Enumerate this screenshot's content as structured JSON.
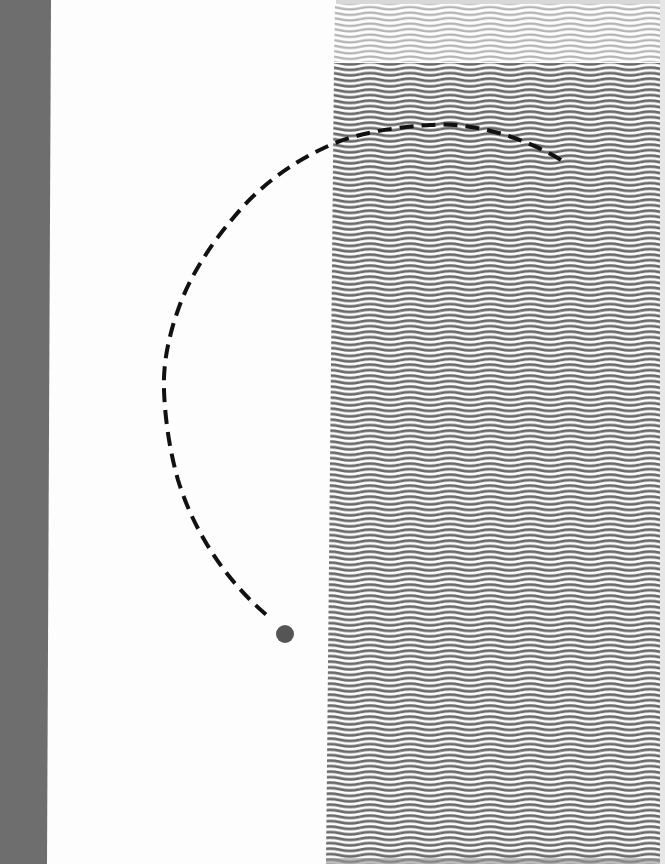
{
  "artwork": {
    "background_color": "#fdfdfd",
    "left_bar": {
      "color": "#6e6e6e",
      "top_width": 51,
      "bottom_width": 47
    },
    "wave_field": {
      "left_edge_top": 335,
      "left_edge_bottom": 326,
      "right_edge": 660,
      "line_spacing": 5.5,
      "wave_period": 40,
      "wave_amplitude": 2,
      "light_band": {
        "color": "#b4b4b4",
        "top": 4,
        "bottom": 62
      },
      "dark_band": {
        "color": "#6a6a6a",
        "top": 63,
        "bottom": 864
      }
    },
    "dashed_arc": {
      "color": "#111111",
      "stroke_width": 4,
      "dash": "14 8",
      "points": [
        [
          561,
          160
        ],
        [
          430,
          125
        ],
        [
          335,
          143
        ],
        [
          240,
          210
        ],
        [
          178,
          310
        ],
        [
          164,
          390
        ],
        [
          178,
          480
        ],
        [
          270,
          618
        ]
      ]
    },
    "dot": {
      "cx": 285,
      "cy": 634,
      "r": 9,
      "color": "#555555"
    }
  }
}
